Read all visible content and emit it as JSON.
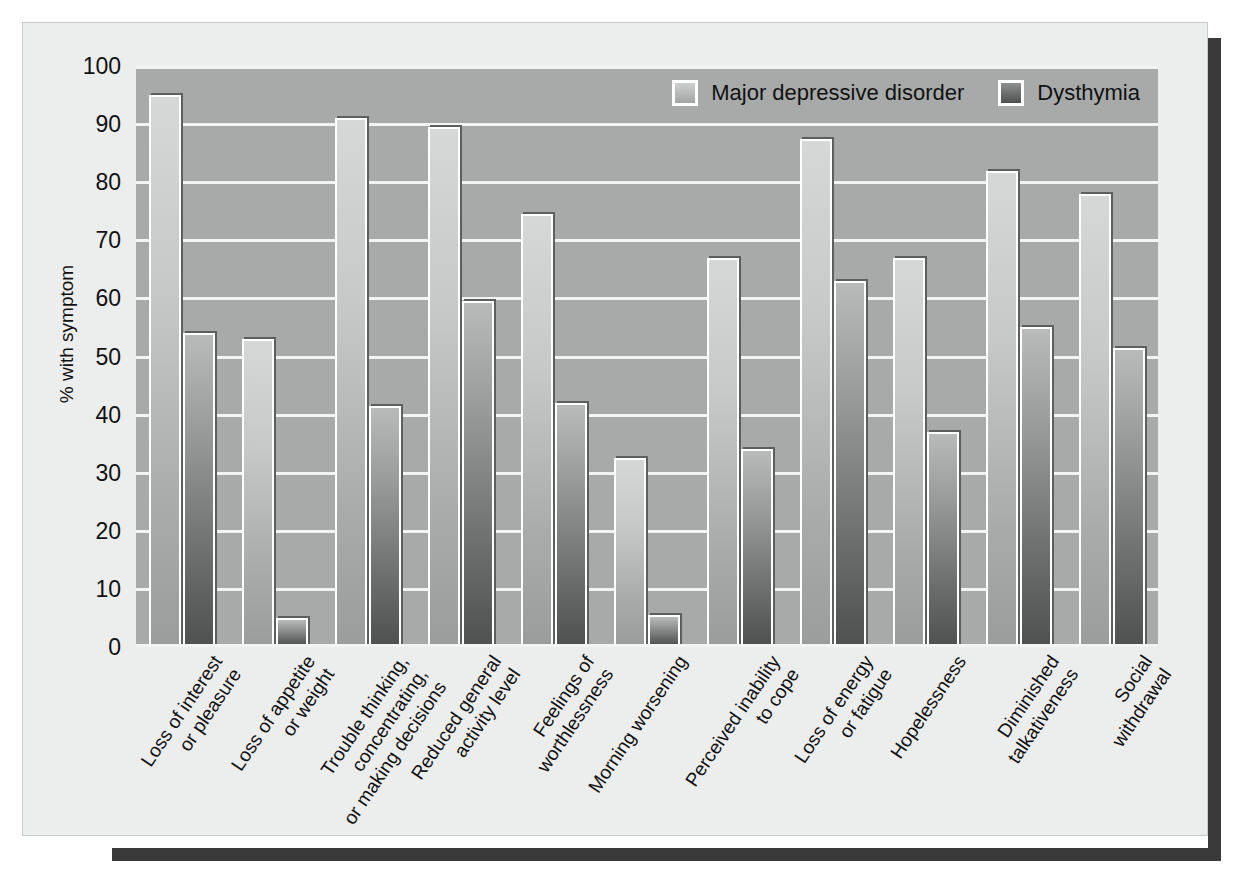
{
  "chart_data": {
    "type": "bar",
    "title": "",
    "xlabel": "",
    "ylabel": "% with symptom",
    "ylim": [
      0,
      100
    ],
    "ytick_labels": [
      "100",
      "90",
      "80",
      "70",
      "60",
      "50",
      "40",
      "30",
      "20",
      "10",
      "0"
    ],
    "ytick_values": [
      100,
      90,
      80,
      70,
      60,
      50,
      40,
      30,
      20,
      10,
      0
    ],
    "grid": true,
    "legend_position": "top-right",
    "categories": [
      "Loss of interest\nor pleasure",
      "Loss of appetite\nor weight",
      "Trouble thinking,\nconcentrating,\nor making decisions",
      "Reduced general\nactivity level",
      "Feelings of\nworthlessness",
      "Morning worsening",
      "Perceived inability\nto cope",
      "Loss of energy\nor fatigue",
      "Hopelessness",
      "Diminished\ntalkativeness",
      "Social\nwithdrawal"
    ],
    "series": [
      {
        "name": "Major depressive disorder",
        "color": "#c3c5c5",
        "values": [
          95,
          53,
          91,
          89.5,
          74.5,
          32.5,
          67,
          87.5,
          67,
          82,
          78
        ]
      },
      {
        "name": "Dysthymia",
        "color": "#6b6d6d",
        "values": [
          54,
          5,
          41.5,
          59.5,
          42,
          5.5,
          34,
          63,
          37,
          55,
          51.5
        ]
      }
    ]
  },
  "legend": {
    "items": [
      {
        "label": "Major depressive disorder",
        "swatch": "mdd"
      },
      {
        "label": "Dysthymia",
        "swatch": "dys"
      }
    ]
  }
}
